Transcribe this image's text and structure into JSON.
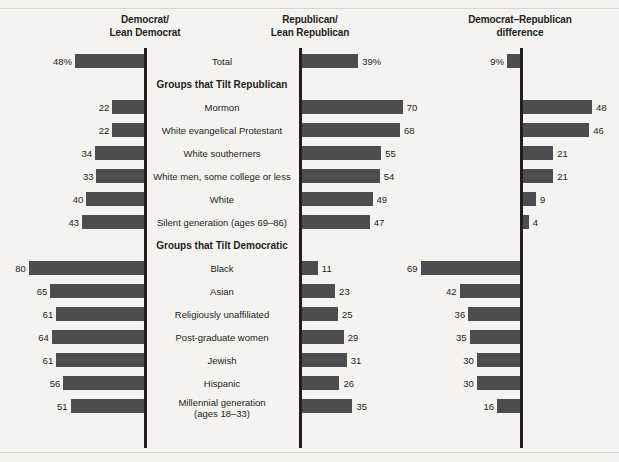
{
  "headers": {
    "democrat": "Democrat/\nLean Democrat",
    "democrat_line1": "Democrat/",
    "democrat_line2": "Lean Democrat",
    "republican_line1": "Republican/",
    "republican_line2": "Lean Republican",
    "difference_line1": "Democrat–Republican",
    "difference_line2": "difference"
  },
  "sections": {
    "tilt_republican": "Groups that Tilt Republican",
    "tilt_democratic": "Groups that Tilt Democratic"
  },
  "colors": {
    "bar": "#4d4d4f",
    "axis": "#231f20",
    "background": "#f4f3f1",
    "rule": "#d9d7d3",
    "text": "#231f20"
  },
  "chart_data": {
    "type": "bar",
    "xlabel": "",
    "ylabel": "",
    "orientation": "horizontal-diverging",
    "grid": false,
    "legend_position": "top-column-headers",
    "series": [
      {
        "name": "Democrat/Lean Democrat",
        "direction": "left",
        "axis_x": 145,
        "values": [
          48,
          22,
          22,
          34,
          33,
          40,
          43,
          80,
          65,
          61,
          64,
          61,
          56,
          51
        ]
      },
      {
        "name": "Republican/Lean Republican",
        "direction": "right",
        "axis_x": 300,
        "values": [
          39,
          70,
          68,
          55,
          54,
          49,
          47,
          11,
          23,
          25,
          29,
          31,
          26,
          35
        ]
      },
      {
        "name": "Democrat–Republican difference",
        "direction": "mixed",
        "axis_x": 521,
        "values": [
          9,
          48,
          46,
          21,
          21,
          9,
          4,
          69,
          42,
          36,
          35,
          30,
          30,
          16
        ]
      }
    ],
    "categories": [
      "Total",
      "Mormon",
      "White evangelical Protestant",
      "White southerners",
      "White men, some college or less",
      "White",
      "Silent generation (ages 69–86)",
      "Black",
      "Asian",
      "Religiously unaffiliated",
      "Post-graduate women",
      "Jewish",
      "Hispanic",
      "Millennial generation (ages 18–33)"
    ],
    "rows": [
      {
        "label": "Total",
        "label_line2": "",
        "section": "total",
        "dem": 48,
        "dem_text": "48%",
        "rep": 39,
        "rep_text": "39%",
        "diff": 9,
        "diff_text": "9%",
        "diff_direction": "left"
      },
      {
        "label": "Mormon",
        "label_line2": "",
        "section": "tilt_republican",
        "dem": 22,
        "dem_text": "22",
        "rep": 70,
        "rep_text": "70",
        "diff": 48,
        "diff_text": "48",
        "diff_direction": "right"
      },
      {
        "label": "White evangelical Protestant",
        "label_line2": "",
        "section": "tilt_republican",
        "dem": 22,
        "dem_text": "22",
        "rep": 68,
        "rep_text": "68",
        "diff": 46,
        "diff_text": "46",
        "diff_direction": "right"
      },
      {
        "label": "White southerners",
        "label_line2": "",
        "section": "tilt_republican",
        "dem": 34,
        "dem_text": "34",
        "rep": 55,
        "rep_text": "55",
        "diff": 21,
        "diff_text": "21",
        "diff_direction": "right"
      },
      {
        "label": "White men, some college or less",
        "label_line2": "",
        "section": "tilt_republican",
        "dem": 33,
        "dem_text": "33",
        "rep": 54,
        "rep_text": "54",
        "diff": 21,
        "diff_text": "21",
        "diff_direction": "right"
      },
      {
        "label": "White",
        "label_line2": "",
        "section": "tilt_republican",
        "dem": 40,
        "dem_text": "40",
        "rep": 49,
        "rep_text": "49",
        "diff": 9,
        "diff_text": "9",
        "diff_direction": "right"
      },
      {
        "label": "Silent generation (ages 69–86)",
        "label_line2": "",
        "section": "tilt_republican",
        "dem": 43,
        "dem_text": "43",
        "rep": 47,
        "rep_text": "47",
        "diff": 4,
        "diff_text": "4",
        "diff_direction": "right"
      },
      {
        "label": "Black",
        "label_line2": "",
        "section": "tilt_democratic",
        "dem": 80,
        "dem_text": "80",
        "rep": 11,
        "rep_text": "11",
        "diff": 69,
        "diff_text": "69",
        "diff_direction": "left"
      },
      {
        "label": "Asian",
        "label_line2": "",
        "section": "tilt_democratic",
        "dem": 65,
        "dem_text": "65",
        "rep": 23,
        "rep_text": "23",
        "diff": 42,
        "diff_text": "42",
        "diff_direction": "left"
      },
      {
        "label": "Religiously unaffiliated",
        "label_line2": "",
        "section": "tilt_democratic",
        "dem": 61,
        "dem_text": "61",
        "rep": 25,
        "rep_text": "25",
        "diff": 36,
        "diff_text": "36",
        "diff_direction": "left"
      },
      {
        "label": "Post-graduate women",
        "label_line2": "",
        "section": "tilt_democratic",
        "dem": 64,
        "dem_text": "64",
        "rep": 29,
        "rep_text": "29",
        "diff": 35,
        "diff_text": "35",
        "diff_direction": "left"
      },
      {
        "label": "Jewish",
        "label_line2": "",
        "section": "tilt_democratic",
        "dem": 61,
        "dem_text": "61",
        "rep": 31,
        "rep_text": "31",
        "diff": 30,
        "diff_text": "30",
        "diff_direction": "left"
      },
      {
        "label": "Hispanic",
        "label_line2": "",
        "section": "tilt_democratic",
        "dem": 56,
        "dem_text": "56",
        "rep": 26,
        "rep_text": "26",
        "diff": 30,
        "diff_text": "30",
        "diff_direction": "left"
      },
      {
        "label": "Millennial generation",
        "label_line2": "(ages 18–33)",
        "section": "tilt_democratic",
        "dem": 51,
        "dem_text": "51",
        "rep": 35,
        "rep_text": "35",
        "diff": 16,
        "diff_text": "16",
        "diff_direction": "left"
      }
    ]
  }
}
